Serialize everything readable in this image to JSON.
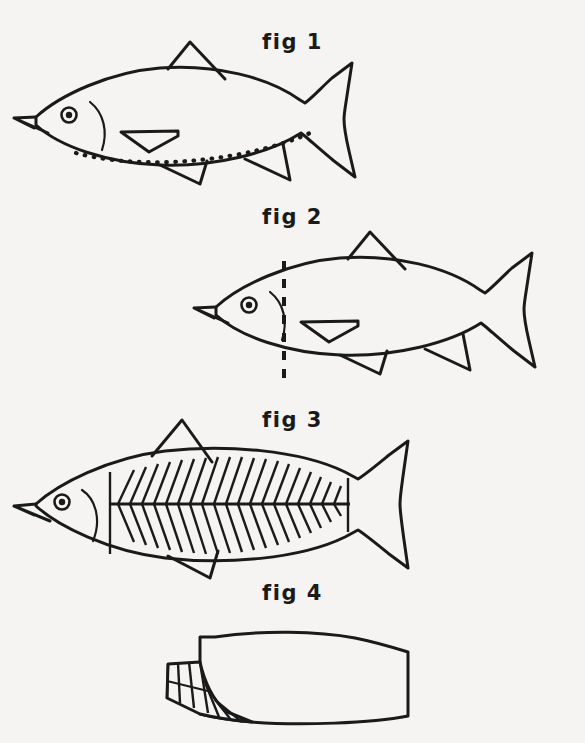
{
  "page": {
    "background_color": "#f5f4f2",
    "ink_color": "#1a1a1a",
    "width": 585,
    "height": 743
  },
  "figures": [
    {
      "id": "fig-1",
      "label": "fig 1",
      "label_y": 30,
      "art_y": 55,
      "caption_subject": "whole fish with dotted belly cut line",
      "annotation": "dotted-belly-line",
      "parts": [
        "head",
        "eye",
        "mouth",
        "gill-cover",
        "dorsal-fin",
        "pectoral-fin",
        "pelvic-fin",
        "anal-fin",
        "caudal-fin",
        "dotted-belly-line"
      ]
    },
    {
      "id": "fig-2",
      "label": "fig 2",
      "label_y": 205,
      "art_y": 245,
      "caption_subject": "whole fish with vertical dashed cut behind the head",
      "annotation": "vertical-dashed-cut-line",
      "parts": [
        "head",
        "eye",
        "mouth",
        "gill-cover",
        "dorsal-fin",
        "pectoral-fin",
        "pelvic-fin",
        "anal-fin",
        "caudal-fin",
        "vertical-dashed-cut-line"
      ]
    },
    {
      "id": "fig-3",
      "label": "fig 3",
      "label_y": 408,
      "art_y": 432,
      "caption_subject": "fish showing herringbone rib and bone structure",
      "annotation": "herringbone-bone-pattern",
      "parts": [
        "head",
        "eye",
        "mouth",
        "gill-cover",
        "dorsal-fin",
        "pelvic-fin",
        "caudal-fin",
        "lateral-line",
        "rib-bones"
      ]
    },
    {
      "id": "fig-4",
      "label": "fig 4",
      "label_y": 581,
      "art_y": 618,
      "caption_subject": "detached fillet with rib cage hatching at the left edge",
      "annotation": "rib-cage-hatching",
      "parts": [
        "fillet-outline",
        "rib-cage-section",
        "rib-hatch-lines"
      ]
    }
  ]
}
